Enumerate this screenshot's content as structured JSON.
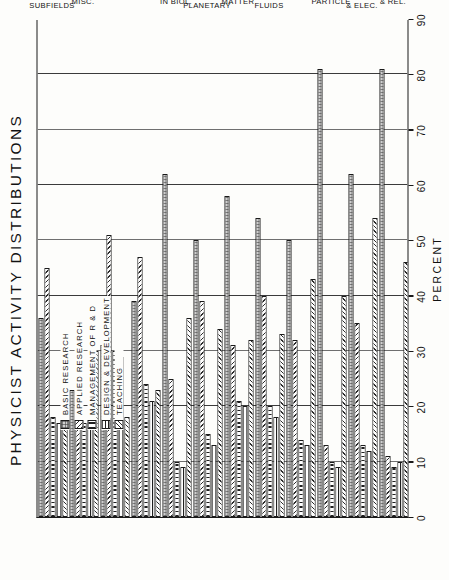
{
  "chart_data": {
    "type": "bar",
    "title": "PHYSICIST ACTIVITY DISTRIBUTIONS",
    "orientation": "vertical-grouped",
    "xlabel": "",
    "ylabel": "PERCENT",
    "ylim": [
      0,
      90
    ],
    "yticks": [
      "0",
      "10",
      "20",
      "30",
      "40",
      "50",
      "60",
      "70",
      "80",
      "90"
    ],
    "grid": true,
    "legend_position": "upper-left-inside",
    "categories": [
      "ASTROPHYS.\n& REL.",
      "ATOMIC,\nMOLEC.,\n& ELEC.",
      "ELEMENT.\nPARTICLE",
      "NUCLEAR",
      "PLASMAS\n& FLUIDS",
      "CONDENS.\nMATTER",
      "EARTH &\nPLANETARY",
      "PHYSICS\nIN BIOL.",
      "OPTICS",
      "ACOUSTICS",
      "OTHER\nMISC.",
      "ALL\nPHYSICS\nSUBFIELDS"
    ],
    "series": [
      {
        "name": "BASIC RESEARCH",
        "pattern": "p-basic",
        "values": [
          81,
          62,
          81,
          50,
          54,
          58,
          50,
          62,
          39,
          31,
          23,
          36
        ]
      },
      {
        "name": "APPLIED RESEARCH",
        "pattern": "p-applied",
        "values": [
          11,
          35,
          13,
          32,
          40,
          31,
          39,
          25,
          47,
          51,
          36,
          45
        ]
      },
      {
        "name": "MANAGEMENT OF R & D",
        "pattern": "p-mgmt",
        "values": [
          9,
          13,
          10,
          14,
          20,
          21,
          15,
          10,
          24,
          30,
          17,
          18
        ]
      },
      {
        "name": "DESIGN & DEVELOPMENT",
        "pattern": "p-design",
        "values": [
          10,
          12,
          9,
          13,
          18,
          20,
          13,
          9,
          21,
          29,
          17,
          17
        ]
      },
      {
        "name": "TEACHING",
        "pattern": "p-teach",
        "values": [
          46,
          54,
          40,
          43,
          33,
          32,
          34,
          36,
          23,
          18,
          30,
          36
        ]
      }
    ]
  },
  "legend": {
    "items": [
      {
        "label": "BASIC RESEARCH"
      },
      {
        "label": "APPLIED RESEARCH"
      },
      {
        "label": "MANAGEMENT OF R & D"
      },
      {
        "label": "DESIGN & DEVELOPMENT"
      },
      {
        "label": "TEACHING"
      }
    ]
  }
}
